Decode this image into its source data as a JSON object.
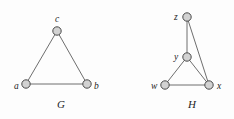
{
  "figure": {
    "background_color": "#fdfdfd",
    "vertex_fill_color": "#d2d2d2",
    "vertex_stroke_color": "#4a4a4a",
    "edge_color": "#6e6e6e",
    "label_color": "#1d1d1d"
  },
  "graphs": [
    {
      "name": "G",
      "name_label_x": 57,
      "name_label_y": 99,
      "vertices": [
        {
          "id": "c",
          "label": "c",
          "cx": 57,
          "cy": 31,
          "r": 4.2,
          "label_x": 55,
          "label_y": 15
        },
        {
          "id": "a",
          "label": "a",
          "cx": 26,
          "cy": 84,
          "r": 4.2,
          "label_x": 14,
          "label_y": 82
        },
        {
          "id": "b",
          "label": "b",
          "cx": 87,
          "cy": 84,
          "r": 4.2,
          "label_x": 94,
          "label_y": 82
        }
      ],
      "edges": [
        {
          "from": "a",
          "to": "c"
        },
        {
          "from": "c",
          "to": "b"
        },
        {
          "from": "a",
          "to": "b"
        }
      ]
    },
    {
      "name": "H",
      "name_label_x": 188,
      "name_label_y": 99,
      "vertices": [
        {
          "id": "z",
          "label": "z",
          "cx": 187,
          "cy": 17,
          "r": 4.2,
          "label_x": 174,
          "label_y": 13
        },
        {
          "id": "y",
          "label": "y",
          "cx": 187,
          "cy": 57,
          "r": 4.2,
          "label_x": 174,
          "label_y": 53
        },
        {
          "id": "w",
          "label": "w",
          "cx": 165,
          "cy": 85,
          "r": 4.2,
          "label_x": 151,
          "label_y": 82
        },
        {
          "id": "x",
          "label": "x",
          "cx": 209,
          "cy": 85,
          "r": 4.2,
          "label_x": 217,
          "label_y": 82
        }
      ],
      "edges": [
        {
          "from": "z",
          "to": "y"
        },
        {
          "from": "z",
          "to": "x"
        },
        {
          "from": "y",
          "to": "w"
        },
        {
          "from": "y",
          "to": "x"
        },
        {
          "from": "w",
          "to": "x"
        }
      ]
    }
  ]
}
